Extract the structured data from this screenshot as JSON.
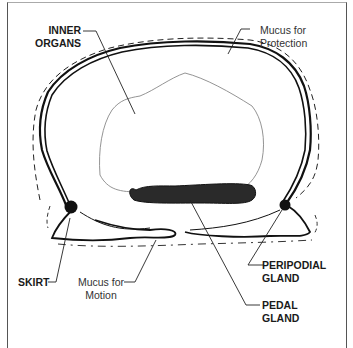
{
  "diagram": {
    "labels": {
      "inner_organs": {
        "line1": "INNER",
        "line2": "ORGANS"
      },
      "mucus_protection": {
        "line1": "Mucus for",
        "line2": "Protection"
      },
      "skirt": {
        "line1": "SKIRT"
      },
      "mucus_motion": {
        "line1": "Mucus for",
        "line2": "Motion"
      },
      "peripodial_gland": {
        "line1": "PERIPODIAL",
        "line2": "GLAND"
      },
      "pedal_gland": {
        "line1": "PEDAL",
        "line2": "GLAND"
      }
    },
    "colors": {
      "ink": "#111111",
      "thin_line": "#777777",
      "frame": "#555555",
      "background": "#ffffff"
    }
  }
}
